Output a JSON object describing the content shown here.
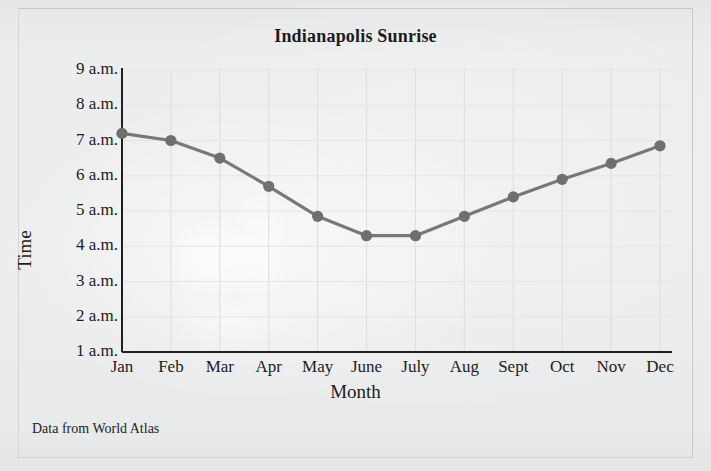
{
  "figure": {
    "title": "Indianapolis Sunrise",
    "source_note": "Data from World Atlas"
  },
  "axes": {
    "y_title": "Time",
    "x_title": "Month",
    "y_tick_labels": [
      "9 a.m.",
      "8 a.m.",
      "7 a.m.",
      "6 a.m.",
      "5 a.m.",
      "4 a.m.",
      "3 a.m.",
      "2 a.m.",
      "1 a.m."
    ],
    "x_tick_labels": [
      "Jan",
      "Feb",
      "Mar",
      "Apr",
      "May",
      "June",
      "July",
      "Aug",
      "Sept",
      "Oct",
      "Nov",
      "Dec"
    ]
  },
  "style": {
    "line_color": "#787878",
    "marker_color": "#6f6f6f",
    "axis_color": "#1f1f1f",
    "gridline_color": "#dcdddd",
    "background_color": "#ebeced"
  },
  "chart_data": {
    "type": "line",
    "title": "Indianapolis Sunrise",
    "xlabel": "Month",
    "ylabel": "Time",
    "categories": [
      "Jan",
      "Feb",
      "Mar",
      "Apr",
      "May",
      "June",
      "July",
      "Aug",
      "Sept",
      "Oct",
      "Nov",
      "Dec"
    ],
    "values": [
      7.2,
      7.0,
      6.5,
      5.7,
      4.85,
      4.3,
      4.3,
      4.85,
      5.4,
      5.9,
      6.35,
      6.85
    ],
    "value_labels": [
      "7:12 a.m.",
      "7:00 a.m.",
      "6:30 a.m.",
      "5:42 a.m.",
      "4:51 a.m.",
      "4:18 a.m.",
      "4:18 a.m.",
      "4:51 a.m.",
      "5:24 a.m.",
      "5:54 a.m.",
      "6:21 a.m.",
      "6:51 a.m."
    ],
    "ylim": [
      1,
      9
    ],
    "ytick_values": [
      1,
      2,
      3,
      4,
      5,
      6,
      7,
      8,
      9
    ],
    "ytick_labels": [
      "1 a.m.",
      "2 a.m.",
      "3 a.m.",
      "4 a.m.",
      "5 a.m.",
      "6 a.m.",
      "7 a.m.",
      "8 a.m.",
      "9 a.m."
    ],
    "grid": "vertical-only",
    "legend": "none",
    "markers": "circle",
    "annotation": "Data from World Atlas"
  }
}
